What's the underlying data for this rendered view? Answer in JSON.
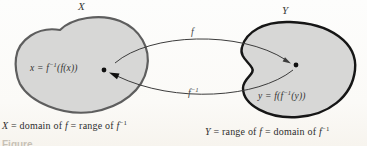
{
  "diagram": {
    "set_x": {
      "label": "X"
    },
    "set_y": {
      "label": "Y"
    },
    "point_x": {
      "pre": "x = f",
      "sup": "−1",
      "post": "(f(x))"
    },
    "point_y": {
      "pre": "y = f(f",
      "sup": "−1",
      "post": "(y))"
    },
    "arrow_f": {
      "label": "f"
    },
    "arrow_f_inverse": {
      "base": "f",
      "sup": "−1"
    },
    "caption_x": {
      "var": "X",
      "seg1": " = domain of ",
      "f1": "f",
      "seg2": " = range of ",
      "f2": "f",
      "sup": "−1"
    },
    "caption_y": {
      "var": "Y",
      "seg1": " = range of ",
      "f1": "f",
      "seg2": " = domain of ",
      "f2": "f",
      "sup": "−1"
    },
    "figure_partial": "Figure",
    "colors": {
      "blob_fill": "#d7d7d6",
      "set_x_stroke": "#5e5e5e",
      "set_y_stroke": "#161616",
      "arrow_stroke": "#3c3c3c",
      "dot_fill": "#101010"
    }
  }
}
